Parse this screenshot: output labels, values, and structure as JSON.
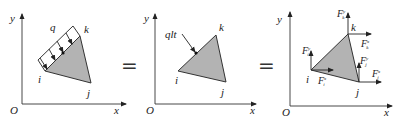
{
  "panels": [
    {
      "axes": {
        "x": "x",
        "y": "y",
        "origin": "O"
      },
      "nodes": {
        "i": "i",
        "j": "j",
        "k": "k"
      },
      "load_label": "q"
    },
    {
      "axes": {
        "x": "x",
        "y": "y",
        "origin": "O"
      },
      "nodes": {
        "i": "i",
        "j": "j",
        "k": "k"
      },
      "load_label": "qlt"
    },
    {
      "axes": {
        "x": "x",
        "y": "y",
        "origin": "O"
      },
      "nodes": {
        "i": "i",
        "j": "j",
        "k": "k"
      },
      "forces": {
        "Fyi": {
          "base": "F",
          "sup": "y",
          "sub": "i"
        },
        "Fxi": {
          "base": "F",
          "sup": "x",
          "sub": "i"
        },
        "Fyj": {
          "base": "F",
          "sup": "y",
          "sub": "j"
        },
        "Fxj": {
          "base": "F",
          "sup": "x",
          "sub": "j"
        },
        "Fyk": {
          "base": "F",
          "sup": "y",
          "sub": "k"
        },
        "Fxk": {
          "base": "F",
          "sup": "x",
          "sub": "k"
        }
      }
    }
  ],
  "operators": [
    "=",
    "="
  ],
  "colors": {
    "triangle_fill": "#b3b3b3",
    "stroke": "#333333"
  }
}
